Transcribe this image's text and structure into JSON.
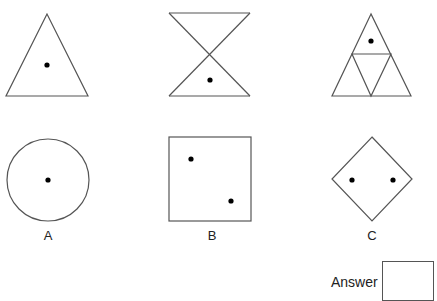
{
  "puzzle": {
    "top_row": [
      {
        "shape": "triangle",
        "dots": 1
      },
      {
        "shape": "hourglass",
        "dots": 1
      },
      {
        "shape": "subdivided-triangle",
        "dots": 1
      }
    ],
    "options": [
      {
        "label": "A",
        "shape": "circle",
        "dots": 1
      },
      {
        "label": "B",
        "shape": "square",
        "dots": 2
      },
      {
        "label": "C",
        "shape": "diamond",
        "dots": 2
      }
    ],
    "answer_label": "Answer",
    "answer_value": "",
    "stroke_color": "#555555",
    "dot_color": "#000000"
  }
}
